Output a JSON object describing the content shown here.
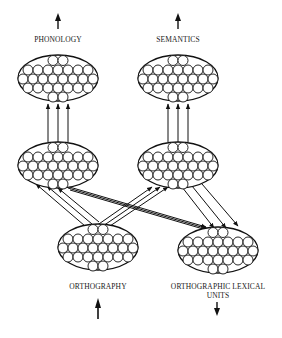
{
  "diagram": {
    "title": "",
    "colors": {
      "stroke": "#111111",
      "background": "#ffffff",
      "text": "#1a1a1a"
    },
    "labels": {
      "phonology": "PHONOLOGY",
      "semantics": "SEMANTICS",
      "orthography": "ORTHOGRAPHY",
      "orthographic_lexical_line1": "ORTHOGRAPHIC LEXICAL",
      "orthographic_lexical_line2": "UNITS"
    },
    "pools": [
      {
        "id": "phonology",
        "label": "PHONOLOGY",
        "cx": 58,
        "cy": 78,
        "layer": "output"
      },
      {
        "id": "semantics",
        "label": "SEMANTICS",
        "cx": 178,
        "cy": 78,
        "layer": "output"
      },
      {
        "id": "hidden-left",
        "label": "",
        "cx": 58,
        "cy": 165,
        "layer": "hidden"
      },
      {
        "id": "hidden-right",
        "label": "",
        "cx": 178,
        "cy": 165,
        "layer": "hidden"
      },
      {
        "id": "orthography",
        "label": "ORTHOGRAPHY",
        "cx": 98,
        "cy": 247,
        "layer": "input"
      },
      {
        "id": "orthographic-lexical-units",
        "label": "ORTHOGRAPHIC LEXICAL UNITS",
        "cx": 218,
        "cy": 250,
        "layer": "output"
      }
    ],
    "io_arrows": [
      {
        "at": "phonology",
        "direction": "up"
      },
      {
        "at": "semantics",
        "direction": "up"
      },
      {
        "at": "orthography",
        "direction": "up"
      },
      {
        "at": "orthographic-lexical-units",
        "direction": "down"
      }
    ],
    "connections": [
      {
        "from": "hidden-left",
        "to": "phonology",
        "lines": 3
      },
      {
        "from": "hidden-right",
        "to": "semantics",
        "lines": 3
      },
      {
        "from": "orthography",
        "to": "hidden-left",
        "lines": 3
      },
      {
        "from": "orthography",
        "to": "hidden-right",
        "lines": 3
      },
      {
        "from": "hidden-left",
        "to": "orthographic-lexical-units",
        "lines": 3
      },
      {
        "from": "hidden-right",
        "to": "orthographic-lexical-units",
        "lines": 3
      }
    ]
  }
}
